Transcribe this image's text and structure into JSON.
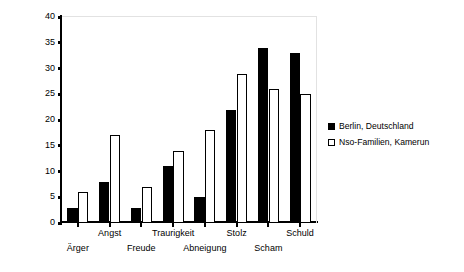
{
  "chart_data": {
    "type": "bar",
    "title": "",
    "subtitle": "",
    "xlabel": "",
    "ylabel": "Alter in Monaten (Durchschnittswerte)",
    "ylim": [
      0,
      40
    ],
    "ytick_labels": [
      "0",
      "5",
      "10",
      "15",
      "20",
      "25",
      "30",
      "35",
      "40"
    ],
    "ytick_values": [
      0,
      5,
      10,
      15,
      20,
      25,
      30,
      35,
      40
    ],
    "grid": false,
    "legend_position": "right",
    "categories": [
      "Ärger",
      "Angst",
      "Freude",
      "Traurigkeit",
      "Abneigung",
      "Stolz",
      "Scham",
      "Schuld"
    ],
    "series": [
      {
        "name": "Berlin, Deutschland",
        "color": "#000000",
        "style": "filled",
        "values": [
          3,
          8,
          3,
          11,
          5,
          22,
          34,
          33
        ]
      },
      {
        "name": "Nso-Familien, Kamerun",
        "color": "#ffffff",
        "style": "outlined",
        "values": [
          6,
          17,
          7,
          14,
          18,
          29,
          26,
          25
        ]
      }
    ]
  },
  "legend": {
    "entries": [
      {
        "label": "Berlin, Deutschland",
        "swatch": "black"
      },
      {
        "label": "Nso-Familien, Kamerun",
        "swatch": "white"
      }
    ]
  }
}
